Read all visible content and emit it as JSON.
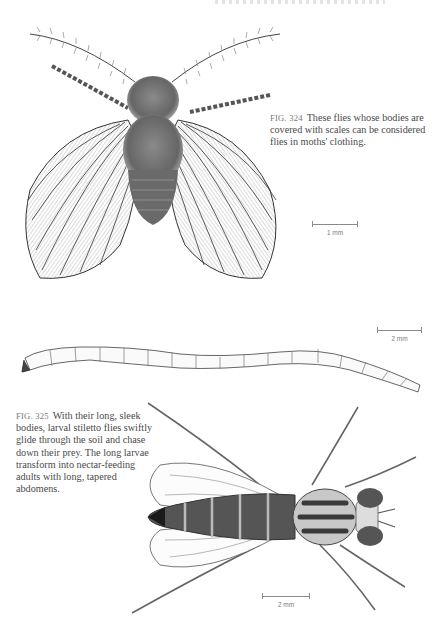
{
  "page": {
    "running_header": "",
    "background": "#ffffff",
    "text_color": "#4a4a4a"
  },
  "figures": [
    {
      "id": "fig-324",
      "subject": "moth fly (adult, dorsal view, wings spread)",
      "caption": {
        "fig_label": "FIG. 324",
        "text": "These flies whose bodies are covered with scales can be considered flies in moths' clothing.",
        "lines": [
          "These flies whose bodies are",
          "covered with scales can be considered",
          "flies in moths' clothing."
        ]
      },
      "scale_bar": {
        "label": "1 mm"
      }
    },
    {
      "id": "fig-325",
      "subject": "stiletto fly larva (lateral) and adult (dorsal view)",
      "caption": {
        "fig_label": "FIG. 325",
        "text": "With their long, sleek bodies, larval stiletto flies swiftly glide through the soil and chase down their prey. The long larvae transform into nectar-feeding adults with long, tapered abdomens.",
        "lines": [
          "With their long, sleek",
          "bodies, larval stiletto flies swiftly",
          "glide through the soil and chase",
          "down their prey. The long larvae",
          "transform into nectar-feeding",
          "adults with long, tapered",
          "abdomens."
        ]
      },
      "scale_bars": [
        {
          "label": "2 mm",
          "for": "larva"
        },
        {
          "label": "2 mm",
          "for": "adult"
        }
      ]
    }
  ]
}
